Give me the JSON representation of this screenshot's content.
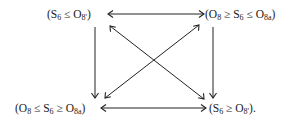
{
  "diagram": {
    "nodes": [
      {
        "id": "top-left",
        "parts": [
          "(S",
          "6",
          " ≤ O",
          "8'",
          ")"
        ]
      },
      {
        "id": "top-right",
        "parts": [
          "(O",
          "8",
          " ≥ S",
          "6",
          " ≤ O",
          "8a",
          ")"
        ]
      },
      {
        "id": "bottom-left",
        "parts": [
          "(O",
          "8",
          " ≤ S",
          "6",
          " ≥ O",
          "8a",
          ")"
        ]
      },
      {
        "id": "bottom-right",
        "parts": [
          "(S",
          "6",
          " ≥ O",
          "8'",
          ")."
        ]
      }
    ],
    "edges": [
      {
        "from": "top-left",
        "to": "top-right",
        "type": "bidirectional"
      },
      {
        "from": "bottom-left",
        "to": "bottom-right",
        "type": "bidirectional"
      },
      {
        "from": "top-left",
        "to": "bottom-left",
        "type": "directed"
      },
      {
        "from": "top-right",
        "to": "bottom-right",
        "type": "directed"
      },
      {
        "from": "top-left",
        "to": "bottom-right",
        "type": "bidirectional"
      },
      {
        "from": "top-right",
        "to": "bottom-left",
        "type": "bidirectional"
      }
    ]
  }
}
